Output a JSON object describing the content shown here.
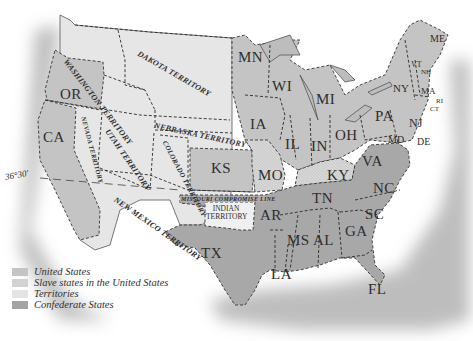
{
  "map": {
    "parallel_label": "36°30′",
    "compromise_line_label": "MISSOURI   COMPROMISE LINE",
    "colors": {
      "union": "#c4c4c4",
      "slave_union": "#d2d2d2",
      "territory": "#e4e4e4",
      "confederate": "#a4a4a4",
      "ocean": "#9a9a9a",
      "border": "#2a2a2a"
    },
    "territories": {
      "washington": "WASHINGTON TERRITORY",
      "dakota": "DAKOTA TERRITORY",
      "nebraska": "NEBRASKA TERRITORY",
      "nevada": "NEVADA TERRITORY",
      "utah": "UTAH TERRITORY",
      "colorado": "COLORADO TERRITORY",
      "new_mexico": "NEW MEXICO TERRITORY",
      "indian": "INDIAN TERRITORY"
    },
    "states": {
      "OR": "OR",
      "CA": "CA",
      "KS": "KS",
      "MN": "MN",
      "WI": "WI",
      "MI": "MI",
      "IA": "IA",
      "IL": "IL",
      "IN": "IN",
      "OH": "OH",
      "MO": "MO",
      "KY": "KY",
      "PA": "PA",
      "NY": "NY",
      "NJ": "NJ",
      "MD": "MD",
      "DE": "DE",
      "VA": "VA",
      "NC": "NC",
      "SC": "SC",
      "TN": "TN",
      "AR": "AR",
      "TX": "TX",
      "LA": "LA",
      "MS": "MS",
      "AL": "AL",
      "GA": "GA",
      "FL": "FL",
      "ME": "ME",
      "VT": "VT",
      "NH": "NH",
      "MA": "MA",
      "RI": "RI",
      "CT": "CT"
    }
  },
  "legend": [
    {
      "label": "United States",
      "color": "#c4c4c4"
    },
    {
      "label": "Slave states in the United States",
      "color": "#d2d2d2"
    },
    {
      "label": "Territories",
      "color": "#e4e4e4"
    },
    {
      "label": "Confederate States",
      "color": "#a4a4a4"
    }
  ]
}
